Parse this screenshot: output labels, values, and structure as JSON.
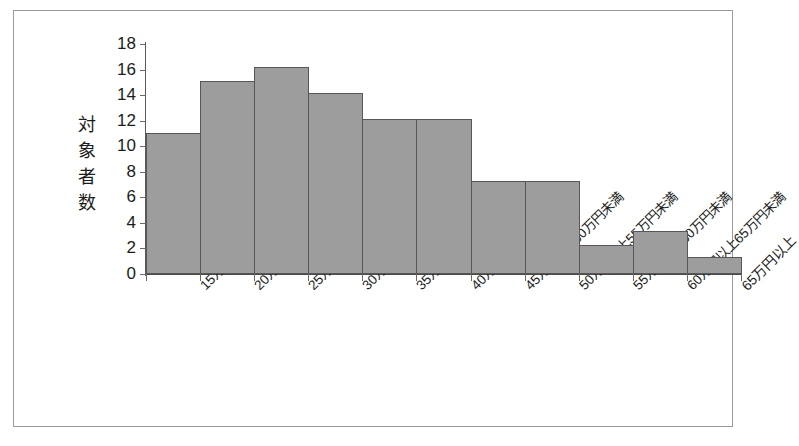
{
  "chart_data": {
    "type": "bar",
    "title": "",
    "subtitle": "",
    "xlabel": "",
    "ylabel": "対象者数",
    "ylim": [
      0,
      18
    ],
    "ytick_step": 2,
    "yticks": [
      0,
      2,
      4,
      6,
      8,
      10,
      12,
      14,
      16,
      18
    ],
    "ytick_labels": [
      "0",
      "2",
      "4",
      "6",
      "8",
      "10",
      "12",
      "14",
      "16",
      "18"
    ],
    "grid": false,
    "legend": false,
    "legend_position": "none",
    "bar_gap": 0,
    "categories": [
      "15万円以上20万円未満",
      "20万円以上25万円未満",
      "25万円以上30万円未満",
      "30万円以上35万円未満",
      "35万円以上40万円未満",
      "40万円以上45万円未満",
      "45万円以上50万円未満",
      "50万円以上55万円未満",
      "55万円以上60万円未満",
      "60万円以上65万円未満",
      "65万円以上"
    ],
    "values": [
      11.0,
      15.1,
      16.2,
      14.2,
      12.1,
      12.1,
      7.3,
      7.3,
      2.3,
      3.4,
      1.3
    ],
    "series": [
      {
        "name": "対象者数",
        "values": [
          11.0,
          15.1,
          16.2,
          14.2,
          12.1,
          12.1,
          7.3,
          7.3,
          2.3,
          3.4,
          1.3
        ]
      }
    ]
  },
  "style": {
    "bar_fill": "#9d9d9d",
    "bar_stroke": "#575757",
    "axis_color": "#5a5a5a",
    "frame_color": "#9a9a9a",
    "text_color": "#1c1c1c",
    "background": "#ffffff"
  },
  "axis_title_chars": [
    "対",
    "象",
    "者",
    "数"
  ]
}
